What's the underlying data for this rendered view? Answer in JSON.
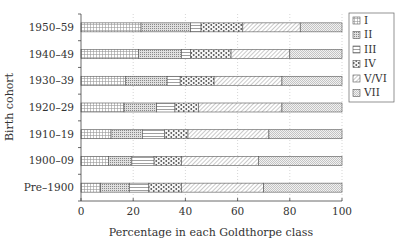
{
  "chart_data": {
    "type": "bar",
    "orientation": "horizontal",
    "stacked": true,
    "title": "",
    "xlabel": "Percentage in each Goldthorpe class",
    "ylabel": "Birth cohort",
    "xlim": [
      0,
      100
    ],
    "xticks": [
      0,
      20,
      40,
      60,
      80,
      100
    ],
    "grid": "vertical dotted at x ticks",
    "legend_position": "right",
    "categories": [
      "1950–59",
      "1940–49",
      "1930–39",
      "1920–29",
      "1910–19",
      "1900–09",
      "Pre–1900"
    ],
    "series": [
      {
        "name": "I",
        "pattern": "grid",
        "values": [
          23,
          22,
          17,
          16.5,
          11.5,
          10.5,
          7.5
        ]
      },
      {
        "name": "II",
        "pattern": "dense-dots",
        "values": [
          19,
          16.5,
          16,
          12.5,
          12,
          9,
          11
        ]
      },
      {
        "name": "III",
        "pattern": "horizontal",
        "values": [
          4,
          3.5,
          5,
          7,
          8.5,
          8.5,
          7.5
        ]
      },
      {
        "name": "IV",
        "pattern": "circles",
        "values": [
          16,
          15.5,
          13,
          9,
          9,
          10.5,
          12.5
        ]
      },
      {
        "name": "V/VI",
        "pattern": "diagonal",
        "values": [
          22,
          22.5,
          26,
          32,
          31,
          29.5,
          31.5
        ]
      },
      {
        "name": "VII",
        "pattern": "fine-dots",
        "values": [
          16,
          20,
          23,
          23,
          28,
          32,
          30
        ]
      }
    ]
  },
  "axis": {
    "xlabel": "Percentage in each Goldthorpe class",
    "ylabel": "Birth cohort",
    "xtick_labels": [
      "0",
      "20",
      "40",
      "60",
      "80",
      "100"
    ]
  },
  "legend": {
    "items": [
      "I",
      "II",
      "III",
      "IV",
      "V/VI",
      "VII"
    ]
  }
}
